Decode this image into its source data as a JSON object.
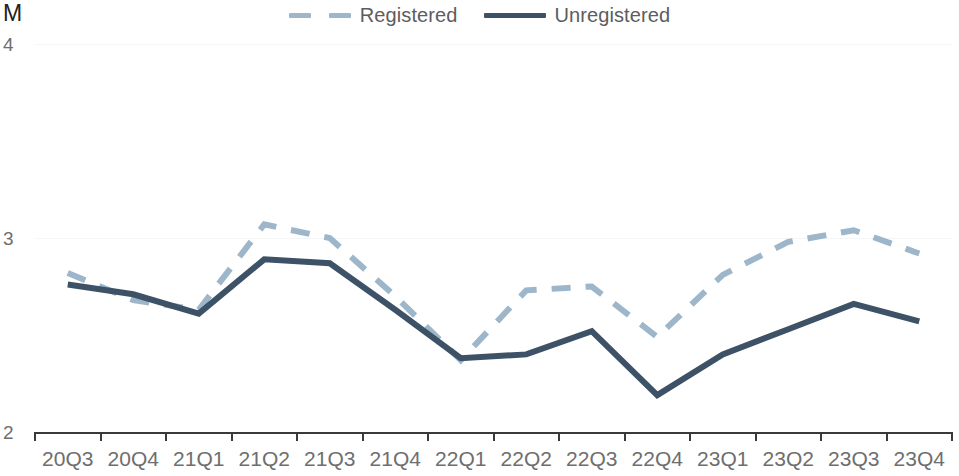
{
  "chart_data": {
    "type": "line",
    "title": "",
    "subtitle": "",
    "xlabel": "",
    "ylabel": "M",
    "unit_label": "M",
    "ylim": [
      2,
      4
    ],
    "yticks": [
      2,
      3,
      4
    ],
    "ytick_labels": [
      "2",
      "3",
      "4"
    ],
    "grid": true,
    "grid_axis": "y",
    "legend_position": "top-center",
    "categories": [
      "20Q3",
      "20Q4",
      "21Q1",
      "21Q2",
      "21Q3",
      "21Q4",
      "22Q1",
      "22Q2",
      "22Q3",
      "22Q4",
      "23Q1",
      "23Q2",
      "23Q3",
      "23Q4"
    ],
    "series": [
      {
        "name": "Registered",
        "style": "dashed",
        "color": "#9db6ca",
        "values": [
          2.82,
          2.68,
          2.63,
          3.07,
          3.0,
          2.7,
          2.37,
          2.73,
          2.75,
          2.49,
          2.81,
          2.98,
          3.04,
          2.92
        ]
      },
      {
        "name": "Unregistered",
        "style": "solid",
        "color": "#3d5266",
        "values": [
          2.76,
          2.71,
          2.61,
          2.89,
          2.87,
          2.63,
          2.38,
          2.4,
          2.52,
          2.19,
          2.4,
          2.53,
          2.66,
          2.57
        ]
      }
    ]
  },
  "legend": {
    "items": [
      {
        "label": "Registered",
        "color": "#9db6ca",
        "style": "dashed",
        "icon": "dashed-line-icon"
      },
      {
        "label": "Unregistered",
        "color": "#3d5266",
        "style": "solid",
        "icon": "solid-line-icon"
      }
    ]
  },
  "colors": {
    "registered": "#9db6ca",
    "unregistered": "#3d5266",
    "axis": "#3a3a3a",
    "tick_text": "#6e6e6e",
    "unit_text": "#232323",
    "gridline": "#f3f5f6",
    "background": "#ffffff"
  },
  "geometry": {
    "plot_left": 35,
    "plot_right": 952,
    "y_for_2": 432,
    "y_for_3": 238,
    "y_for_4": 44
  }
}
